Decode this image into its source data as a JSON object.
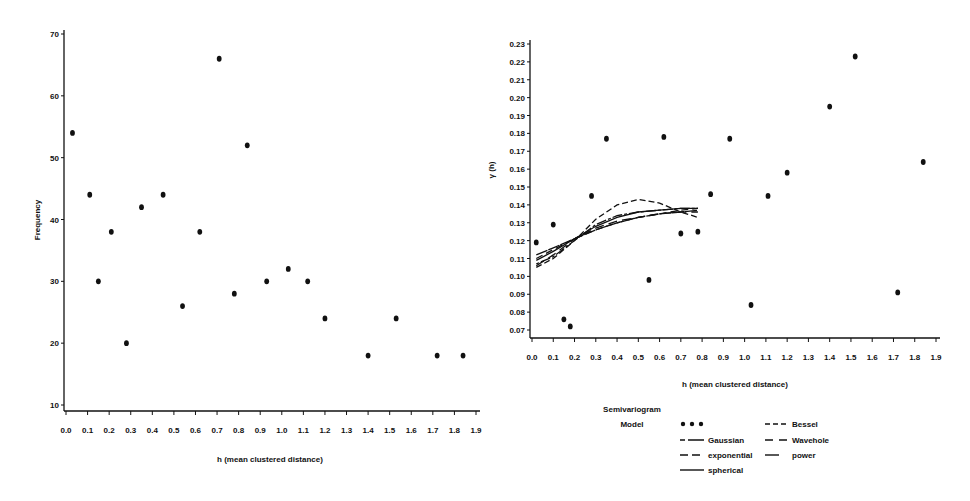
{
  "chart_data": [
    {
      "type": "scatter",
      "title": "",
      "xlabel": "h (mean clustered distance)",
      "ylabel": "Frequency",
      "xlim": [
        0.0,
        1.9
      ],
      "ylim": [
        10,
        70
      ],
      "x_ticks": [
        "0.0",
        "0.1",
        "0.2",
        "0.3",
        "0.4",
        "0.5",
        "0.6",
        "0.7",
        "0.8",
        "0.9",
        "1.0",
        "1.1",
        "1.2",
        "1.3",
        "1.4",
        "1.5",
        "1.6",
        "1.7",
        "1.8",
        "1.9"
      ],
      "y_ticks": [
        "10",
        "20",
        "30",
        "40",
        "50",
        "60",
        "70"
      ],
      "grid": false,
      "series": [
        {
          "name": "Frequency",
          "x": [
            0.03,
            0.11,
            0.15,
            0.21,
            0.28,
            0.35,
            0.45,
            0.54,
            0.62,
            0.71,
            0.78,
            0.84,
            0.93,
            1.03,
            1.12,
            1.2,
            1.4,
            1.53,
            1.72,
            1.84
          ],
          "y": [
            54,
            44,
            30,
            38,
            20,
            42,
            44,
            26,
            38,
            66,
            28,
            52,
            30,
            32,
            30,
            24,
            18,
            24,
            18,
            18
          ]
        }
      ]
    },
    {
      "type": "scatter",
      "title": "",
      "xlabel": "h (mean clustered distance)",
      "ylabel": "γ (h)",
      "xlim": [
        0.0,
        1.9
      ],
      "ylim": [
        0.07,
        0.23
      ],
      "x_ticks": [
        "0.0",
        "0.1",
        "0.2",
        "0.3",
        "0.4",
        "0.5",
        "0.6",
        "0.7",
        "0.8",
        "0.9",
        "1.0",
        "1.1",
        "1.2",
        "1.3",
        "1.4",
        "1.5",
        "1.6",
        "1.7",
        "1.8",
        "1.9"
      ],
      "y_ticks": [
        "0.07",
        "0.08",
        "0.09",
        "0.10",
        "0.11",
        "0.12",
        "0.13",
        "0.14",
        "0.15",
        "0.16",
        "0.17",
        "0.18",
        "0.19",
        "0.20",
        "0.21",
        "0.22",
        "0.23"
      ],
      "grid": false,
      "legend": {
        "title": [
          "Semivariogram",
          "Model"
        ],
        "position": "bottom",
        "entries": [
          {
            "label": "",
            "style": "dots"
          },
          {
            "label": "Gaussian",
            "style": "long-short"
          },
          {
            "label": "exponential",
            "style": "dashed"
          },
          {
            "label": "spherical",
            "style": "solid"
          },
          {
            "label": "Bessel",
            "style": "short-dash"
          },
          {
            "label": "Wavehole",
            "style": "medium-dash"
          },
          {
            "label": "power",
            "style": "solid-short"
          }
        ]
      },
      "series": [
        {
          "name": "empirical",
          "x": [
            0.02,
            0.1,
            0.15,
            0.18,
            0.28,
            0.35,
            0.55,
            0.62,
            0.7,
            0.78,
            0.84,
            0.93,
            1.03,
            1.11,
            1.2,
            1.4,
            1.52,
            1.72,
            1.84
          ],
          "y": [
            0.119,
            0.129,
            0.076,
            0.072,
            0.145,
            0.177,
            0.098,
            0.178,
            0.124,
            0.125,
            0.146,
            0.177,
            0.084,
            0.145,
            0.158,
            0.195,
            0.223,
            0.091,
            0.164
          ]
        },
        {
          "name": "Gaussian",
          "x": [
            0.02,
            0.1,
            0.2,
            0.3,
            0.4,
            0.5,
            0.6,
            0.7,
            0.78
          ],
          "y": [
            0.107,
            0.111,
            0.12,
            0.129,
            0.134,
            0.136,
            0.137,
            0.138,
            0.138
          ]
        },
        {
          "name": "exponential",
          "x": [
            0.02,
            0.1,
            0.2,
            0.3,
            0.4,
            0.5,
            0.6,
            0.7,
            0.78
          ],
          "y": [
            0.11,
            0.115,
            0.121,
            0.126,
            0.13,
            0.133,
            0.135,
            0.137,
            0.138
          ]
        },
        {
          "name": "spherical",
          "x": [
            0.02,
            0.1,
            0.2,
            0.3,
            0.4,
            0.5,
            0.6,
            0.7,
            0.78
          ],
          "y": [
            0.109,
            0.114,
            0.121,
            0.128,
            0.133,
            0.136,
            0.137,
            0.138,
            0.138
          ]
        },
        {
          "name": "Bessel",
          "x": [
            0.02,
            0.1,
            0.2,
            0.3,
            0.4,
            0.5,
            0.6,
            0.7,
            0.78
          ],
          "y": [
            0.105,
            0.11,
            0.12,
            0.132,
            0.14,
            0.143,
            0.141,
            0.136,
            0.133
          ]
        },
        {
          "name": "Wavehole",
          "x": [
            0.02,
            0.1,
            0.2,
            0.3,
            0.4,
            0.5,
            0.6,
            0.7,
            0.78
          ],
          "y": [
            0.106,
            0.112,
            0.121,
            0.127,
            0.131,
            0.133,
            0.135,
            0.136,
            0.136
          ]
        },
        {
          "name": "power",
          "x": [
            0.02,
            0.1,
            0.2,
            0.3,
            0.4,
            0.5,
            0.6,
            0.7,
            0.78
          ],
          "y": [
            0.112,
            0.116,
            0.121,
            0.126,
            0.13,
            0.133,
            0.135,
            0.136,
            0.137
          ]
        }
      ]
    }
  ],
  "left_chart": {
    "xlabel": "h (mean clustered distance)",
    "ylabel": "Frequency"
  },
  "right_chart": {
    "xlabel": "h (mean clustered distance)",
    "ylabel": "γ (h)",
    "legend": {
      "title_line1": "Semivariogram",
      "title_line2": "Model",
      "gaussian": "Gaussian",
      "exponential": "exponential",
      "spherical": "spherical",
      "bessel": "Bessel",
      "wavehole": "Wavehole",
      "power": "power"
    }
  }
}
